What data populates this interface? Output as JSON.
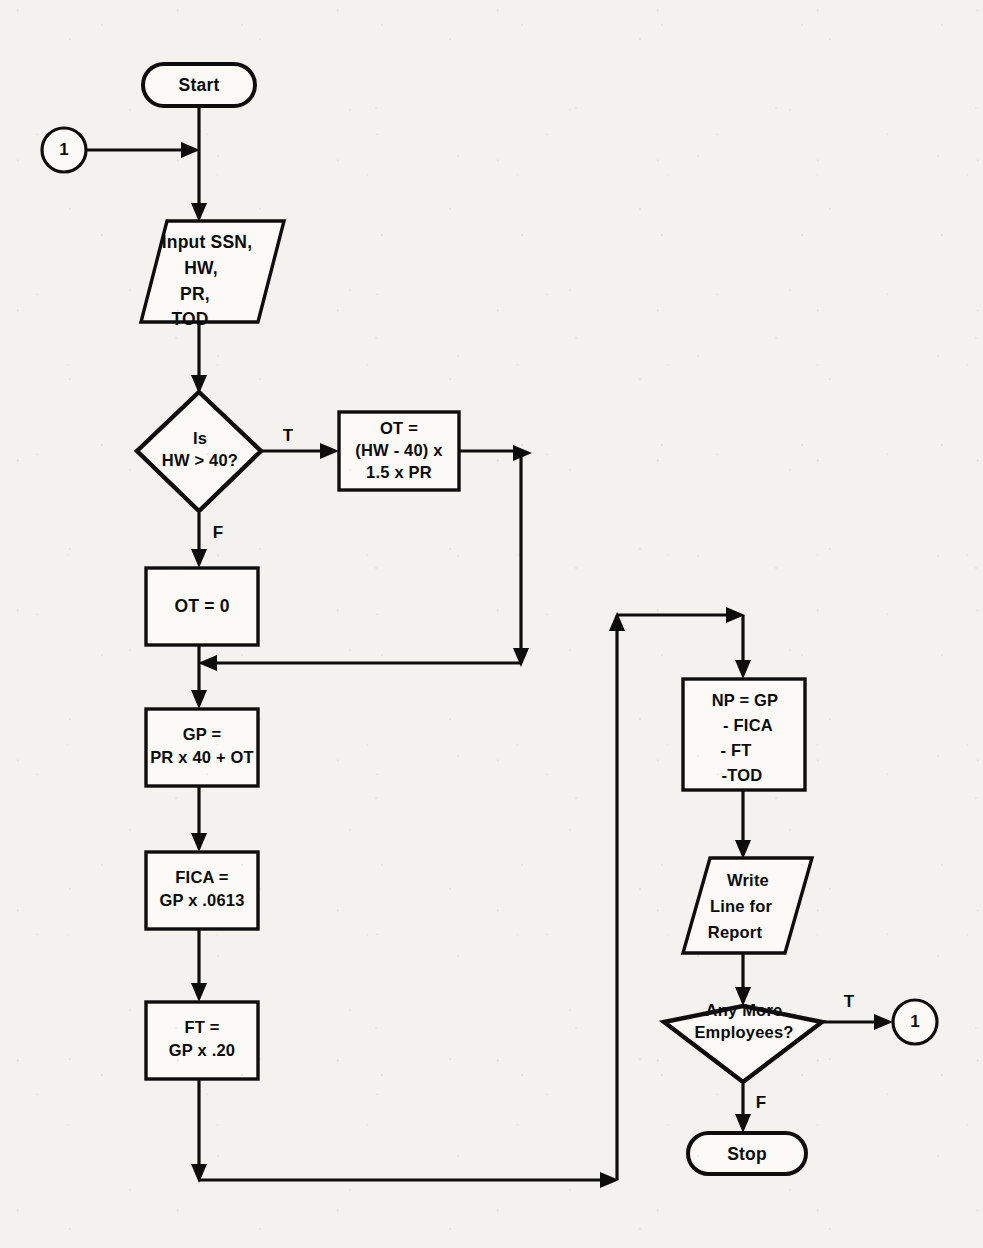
{
  "diagram": {
    "type": "flowchart",
    "colors": {
      "stroke": "#0d0d0d",
      "fill": "#fbfaf7",
      "background": "#f3f2ee"
    }
  },
  "nodes": {
    "start": {
      "label": "Start",
      "shape": "terminator"
    },
    "connector_in": {
      "label": "1",
      "shape": "connector"
    },
    "input": {
      "line1": "Input SSN,",
      "line2": "HW,",
      "line3": "PR,",
      "line4": "TOD",
      "shape": "parallelogram"
    },
    "decision_hw": {
      "line1": "Is",
      "line2": "HW > 40?",
      "shape": "decision"
    },
    "ot_calc": {
      "line1": "OT =",
      "line2": "(HW - 40) x",
      "line3": "1.5 x PR",
      "shape": "process"
    },
    "ot_zero": {
      "line1": "OT = 0",
      "shape": "process"
    },
    "gp": {
      "line1": "GP =",
      "line2": "PR x 40 + OT",
      "shape": "process"
    },
    "fica": {
      "line1": "FICA =",
      "line2": "GP x .0613",
      "shape": "process"
    },
    "ft": {
      "line1": "FT =",
      "line2": "GP x .20",
      "shape": "process"
    },
    "np": {
      "line1": "NP = GP",
      "line2": "- FICA",
      "line3": "- FT",
      "line4": "-TOD",
      "shape": "process"
    },
    "write": {
      "line1": "Write",
      "line2": "Line for",
      "line3": "Report",
      "shape": "parallelogram"
    },
    "decision_more": {
      "line1": "Any  More",
      "line2": "Employees?",
      "shape": "decision"
    },
    "connector_out": {
      "label": "1",
      "shape": "connector"
    },
    "stop": {
      "label": "Stop",
      "shape": "terminator"
    }
  },
  "edge_labels": {
    "hw_true": "T",
    "hw_false": "F",
    "more_true": "T",
    "more_false": "F"
  }
}
